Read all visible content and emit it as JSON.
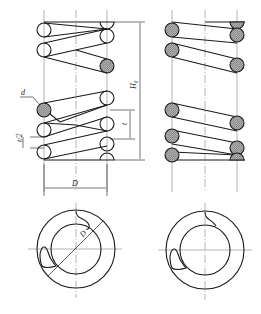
{
  "drawing": {
    "title": "Compression spring technical drawing",
    "colors": {
      "line": "#1a1a1a",
      "hatch_fill": "#9a9a9a",
      "center_line": "#555555",
      "background": "#ffffff"
    },
    "labels": {
      "wire_diameter": "d",
      "half_pitch": "t/2",
      "pitch": "t",
      "free_height": "H₀",
      "mean_diameter": "D",
      "mean_diameter_section": "D"
    },
    "views": [
      {
        "name": "front-view-outline",
        "description": "Spring side view, outline coils"
      },
      {
        "name": "front-view-sectioned",
        "description": "Spring side view, sectioned coils"
      },
      {
        "name": "top-view-left",
        "description": "Spring end view with diameter dimension"
      },
      {
        "name": "top-view-right",
        "description": "Spring end view"
      }
    ]
  }
}
